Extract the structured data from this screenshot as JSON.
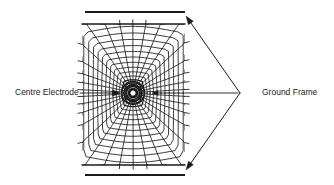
{
  "figure": {
    "kind": "electrostatic-field-plot",
    "title_visible": false,
    "background_color": "#ffffff",
    "ink_color": "#1a1a1a",
    "width": 334,
    "height": 185
  },
  "labels": {
    "centre_electrode": "Centre Electrode",
    "ground_frame": "Ground Frame"
  },
  "annotations": {
    "centre_electrode_leader": {
      "name": "centre-electrode-leader-arrow",
      "from_x": 80,
      "from_y": 93,
      "to_x": 120,
      "to_y": 93,
      "arrowhead": "right"
    },
    "ground_frame_leader_horizontal": {
      "name": "ground-frame-leader-horizontal",
      "from_x": 238,
      "from_y": 93,
      "to_x": 152,
      "to_y": 93,
      "arrowhead": "left"
    },
    "ground_frame_leader_upper": {
      "name": "ground-frame-leader-upper",
      "from_x": 240,
      "from_y": 93,
      "to_x": 186,
      "to_y": 16,
      "arrowhead": "end"
    },
    "ground_frame_leader_lower": {
      "name": "ground-frame-leader-lower",
      "from_x": 240,
      "from_y": 93,
      "to_x": 186,
      "to_y": 170,
      "arrowhead": "end"
    }
  },
  "electrodes": {
    "centre": {
      "name": "centre-electrode",
      "cx": 133,
      "cy": 93,
      "core_radius": 3.1,
      "ring_radii": [
        4.6,
        6.4,
        8.6,
        11.4
      ],
      "fill": "#ffffff",
      "stroke": "#1a1a1a"
    },
    "ground_plate_top": {
      "name": "ground-plate-top",
      "x1": 85,
      "y1": 12,
      "x2": 185,
      "y2": 12,
      "thickness": 2.2
    },
    "ground_plate_bottom": {
      "name": "ground-plate-bottom",
      "x1": 85,
      "y1": 175,
      "x2": 185,
      "y2": 175,
      "thickness": 2.2
    }
  },
  "field_region": {
    "name": "curvilinear-field-mesh",
    "left": 82,
    "right": 185,
    "top": 24,
    "bottom": 165,
    "centre_x": 133,
    "centre_y": 93,
    "flux_line_count": 34,
    "equipotential_count": 13,
    "description": "curvilinear-square flux plot between a centre electrode and two parallel ground plates"
  },
  "chart_data": {
    "type": "line",
    "xlabel": "",
    "ylabel": "",
    "grid": false,
    "legend_position": "none",
    "series": [
      {
        "name": "flux lines",
        "style": "radial",
        "count": 34,
        "origin": [
          133,
          93
        ],
        "description": "lines of electric flux radiating from the centre electrode toward the ground plates"
      },
      {
        "name": "equipotentials",
        "style": "closed-contours",
        "count": 13,
        "origin": [
          133,
          93
        ],
        "description": "equipotential contours encircling the centre electrode, flattening toward the ground plates"
      }
    ]
  }
}
